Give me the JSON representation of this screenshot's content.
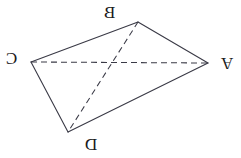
{
  "figure": {
    "width": 241,
    "height": 158,
    "background_color": "#ffffff",
    "stroke_color": "#3a3a46",
    "label_color": "#1a1a1a",
    "mirrored": true,
    "vertices": [
      {
        "id": "A",
        "label": "A",
        "x": 208,
        "y": 63,
        "label_x": 221,
        "label_y": 55,
        "flip": "horizontal-vertical"
      },
      {
        "id": "B",
        "label": "B",
        "x": 138,
        "y": 22,
        "label_x": 104,
        "label_y": 4,
        "flip": "horizontal"
      },
      {
        "id": "C",
        "label": "C",
        "x": 31,
        "y": 62,
        "label_x": 6,
        "label_y": 50,
        "flip": "horizontal"
      },
      {
        "id": "D",
        "label": "D",
        "x": 68,
        "y": 132,
        "label_x": 85,
        "label_y": 136,
        "flip": "horizontal"
      }
    ],
    "edges": [
      {
        "id": "CB",
        "from": "C",
        "to": "B",
        "style": "solid"
      },
      {
        "id": "BA",
        "from": "B",
        "to": "A",
        "style": "solid"
      },
      {
        "id": "AD",
        "from": "A",
        "to": "D",
        "style": "solid"
      },
      {
        "id": "DC",
        "from": "D",
        "to": "C",
        "style": "solid"
      }
    ],
    "diagonals": [
      {
        "id": "CA",
        "from": "C",
        "to": "A",
        "style": "dashed"
      },
      {
        "id": "BD",
        "from": "B",
        "to": "D",
        "style": "dashed"
      }
    ]
  }
}
